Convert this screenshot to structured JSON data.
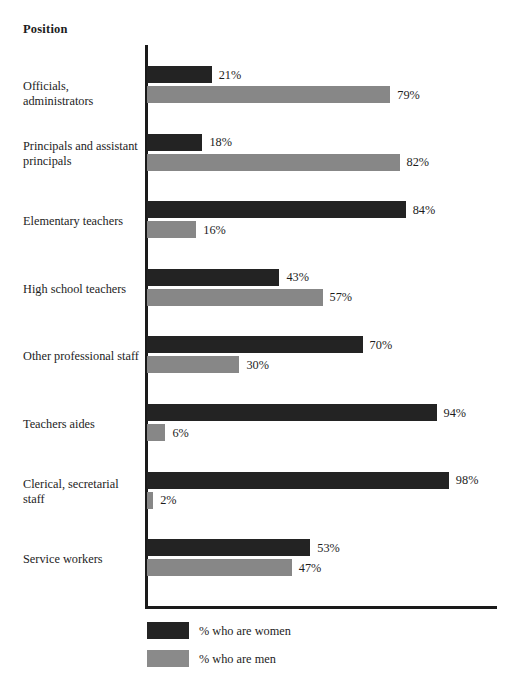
{
  "chart_data": {
    "type": "bar",
    "title": "",
    "xlabel": "",
    "ylabel": "Position",
    "orientation": "horizontal",
    "grid": false,
    "xlim": [
      0,
      100
    ],
    "value_suffix": "%",
    "legend_position": "bottom-left",
    "categories": [
      "Officials, administrators",
      "Principals and assistant principals",
      "Elementary teachers",
      "High school teachers",
      "Other professional staff",
      "Teachers aides",
      "Clerical, secretarial staff",
      "Service workers"
    ],
    "series": [
      {
        "name": "% who are women",
        "color": "#232323",
        "values": [
          21,
          18,
          84,
          43,
          70,
          94,
          98,
          53
        ],
        "labels": [
          "21%",
          "18%",
          "84%",
          "43%",
          "70%",
          "94%",
          "98%",
          "53%"
        ]
      },
      {
        "name": "% who are men",
        "color": "#878787",
        "values": [
          79,
          82,
          16,
          57,
          30,
          6,
          2,
          47
        ],
        "labels": [
          "79%",
          "82%",
          "16%",
          "57%",
          "30%",
          "6%",
          "2%",
          "47%"
        ]
      }
    ]
  },
  "axis": {
    "y_title": "Position"
  },
  "legend": {
    "items": [
      {
        "label": "% who are women",
        "color": "#232323"
      },
      {
        "label": "% who are men",
        "color": "#878787"
      }
    ]
  }
}
